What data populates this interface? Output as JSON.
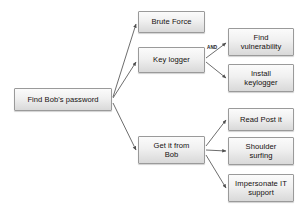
{
  "diagram": {
    "type": "attack-tree",
    "root": {
      "id": "find-bobs-password",
      "label": "Find Bob's password"
    },
    "nodes": [
      {
        "id": "brute-force",
        "label": "Brute Force",
        "level": 1,
        "x": 138,
        "y": 11,
        "w": 67,
        "h": 22
      },
      {
        "id": "key-logger",
        "label": "Key logger",
        "level": 1,
        "x": 138,
        "y": 47,
        "w": 67,
        "h": 26
      },
      {
        "id": "get-it-from-bob",
        "label": "Get it from\nBob",
        "level": 1,
        "x": 138,
        "y": 136,
        "w": 67,
        "h": 28
      },
      {
        "id": "find-vulnerability",
        "label": "Find\nvulnerability",
        "level": 2,
        "x": 228,
        "y": 28,
        "w": 66,
        "h": 28
      },
      {
        "id": "install-keylogger",
        "label": "Install\nkeylogger",
        "level": 2,
        "x": 228,
        "y": 64,
        "w": 66,
        "h": 28
      },
      {
        "id": "read-post-it",
        "label": "Read Post it",
        "level": 2,
        "x": 228,
        "y": 108,
        "w": 66,
        "h": 23
      },
      {
        "id": "shoulder-surfing",
        "label": "Shoulder\nsurfing",
        "level": 2,
        "x": 228,
        "y": 137,
        "w": 66,
        "h": 28
      },
      {
        "id": "impersonate-it",
        "label": "Impersonate IT\nsupport",
        "level": 2,
        "x": 228,
        "y": 174,
        "w": 66,
        "h": 28
      }
    ],
    "root_box": {
      "x": 14,
      "y": 88,
      "w": 98,
      "h": 23
    },
    "gates": [
      {
        "id": "and-gate-keylogger",
        "label": "AND",
        "x": 207,
        "y": 45
      }
    ],
    "edges": [
      {
        "from": "find-bobs-password",
        "to": "brute-force",
        "x1": 113,
        "y1": 97,
        "x2": 136,
        "y2": 24
      },
      {
        "from": "find-bobs-password",
        "to": "key-logger",
        "x1": 113,
        "y1": 98,
        "x2": 136,
        "y2": 62
      },
      {
        "from": "find-bobs-password",
        "to": "get-it-from-bob",
        "x1": 113,
        "y1": 103,
        "x2": 136,
        "y2": 150
      },
      {
        "from": "key-logger",
        "to": "find-vulnerability",
        "x1": 206,
        "y1": 58,
        "x2": 226,
        "y2": 43
      },
      {
        "from": "key-logger",
        "to": "install-keylogger",
        "x1": 206,
        "y1": 62,
        "x2": 226,
        "y2": 78
      },
      {
        "from": "get-it-from-bob",
        "to": "read-post-it",
        "x1": 206,
        "y1": 146,
        "x2": 226,
        "y2": 120
      },
      {
        "from": "get-it-from-bob",
        "to": "shoulder-surfing",
        "x1": 206,
        "y1": 150,
        "x2": 226,
        "y2": 151
      },
      {
        "from": "get-it-from-bob",
        "to": "impersonate-it",
        "x1": 206,
        "y1": 155,
        "x2": 226,
        "y2": 188
      }
    ],
    "colors": {
      "node_border": "#9a9a9a",
      "node_fill_top": "#fbfbfb",
      "node_fill_bottom": "#d9d9d9",
      "edge": "#5c5c5c",
      "text": "#15100f",
      "background": "#ffffff"
    }
  }
}
